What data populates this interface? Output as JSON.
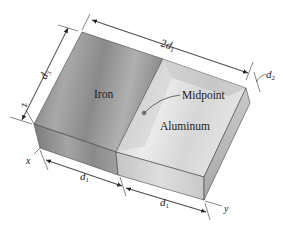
{
  "figure": {
    "type": "isometric-block-diagram",
    "materials": [
      {
        "label": "Iron"
      },
      {
        "label": "Aluminum"
      }
    ],
    "annotations": {
      "midpoint_label": "Midpoint"
    },
    "dimensions": {
      "total_length": {
        "prefix": "2",
        "symbol": "d",
        "subscript": "1"
      },
      "width": {
        "symbol": "d",
        "subscript": "3"
      },
      "thickness": {
        "symbol": "d",
        "subscript": "2"
      },
      "half_length_iron": {
        "symbol": "d",
        "subscript": "1"
      },
      "half_length_aluminum": {
        "symbol": "d",
        "subscript": "1"
      }
    },
    "axes": {
      "x": "x",
      "y": "y",
      "z": "z"
    },
    "colors": {
      "iron_top": "#8e8e8e",
      "aluminum_top": "#d9d9d9",
      "iron_front": "#9a9a9a",
      "aluminum_front": "#cfcfcf",
      "aluminum_side": "#bdbdbd",
      "line": "#333333"
    }
  }
}
